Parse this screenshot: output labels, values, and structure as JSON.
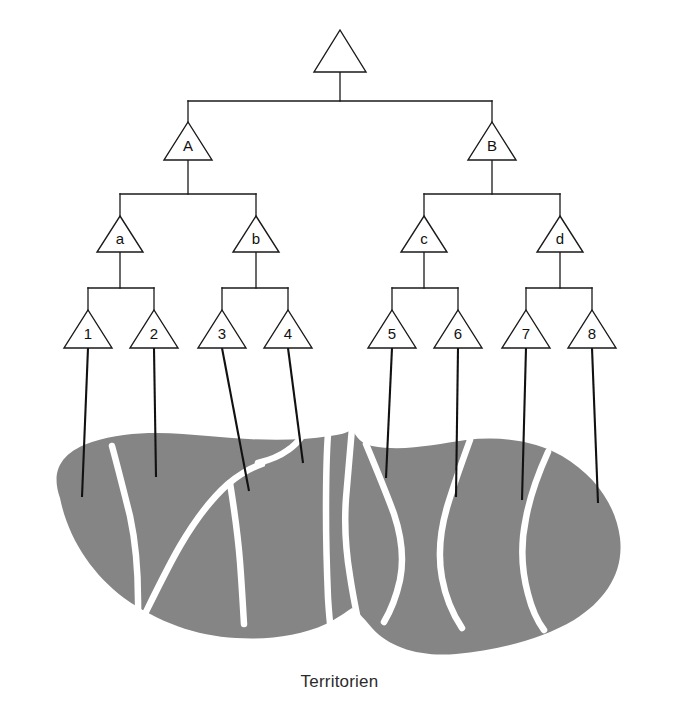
{
  "figure": {
    "caption": "Territorien",
    "colors": {
      "territory_fill": "#858585",
      "territory_border": "#ffffff",
      "line": "#111111",
      "background": "#ffffff"
    }
  },
  "diagram": {
    "type": "hierarchy-tree-with-map",
    "levels": 4,
    "nodes": {
      "root": {
        "label": "",
        "x": 340,
        "y": 55
      },
      "level2": [
        {
          "label": "A",
          "x": 188,
          "y": 143
        },
        {
          "label": "B",
          "x": 492,
          "y": 143
        }
      ],
      "level3": [
        {
          "label": "a",
          "x": 120,
          "y": 236
        },
        {
          "label": "b",
          "x": 256,
          "y": 236
        },
        {
          "label": "c",
          "x": 424,
          "y": 236
        },
        {
          "label": "d",
          "x": 560,
          "y": 236
        }
      ],
      "leaves": [
        {
          "label": "1",
          "x": 88,
          "y": 330
        },
        {
          "label": "2",
          "x": 154,
          "y": 330
        },
        {
          "label": "3",
          "x": 222,
          "y": 330
        },
        {
          "label": "4",
          "x": 288,
          "y": 330
        },
        {
          "label": "5",
          "x": 392,
          "y": 330
        },
        {
          "label": "6",
          "x": 458,
          "y": 330
        },
        {
          "label": "7",
          "x": 526,
          "y": 330
        },
        {
          "label": "8",
          "x": 592,
          "y": 330
        }
      ]
    },
    "edges": [
      {
        "from": "root",
        "to": "A"
      },
      {
        "from": "root",
        "to": "B"
      },
      {
        "from": "A",
        "to": "a"
      },
      {
        "from": "A",
        "to": "b"
      },
      {
        "from": "B",
        "to": "c"
      },
      {
        "from": "B",
        "to": "d"
      },
      {
        "from": "a",
        "to": "1"
      },
      {
        "from": "a",
        "to": "2"
      },
      {
        "from": "b",
        "to": "3"
      },
      {
        "from": "b",
        "to": "4"
      },
      {
        "from": "c",
        "to": "5"
      },
      {
        "from": "c",
        "to": "6"
      },
      {
        "from": "d",
        "to": "7"
      },
      {
        "from": "d",
        "to": "8"
      }
    ],
    "leader_lines": [
      {
        "leaf": "1",
        "x1": 88,
        "y1": 348,
        "x2": 82,
        "y2": 497
      },
      {
        "leaf": "2",
        "x1": 154,
        "y1": 348,
        "x2": 156,
        "y2": 477
      },
      {
        "leaf": "3",
        "x1": 222,
        "y1": 348,
        "x2": 249,
        "y2": 491
      },
      {
        "leaf": "4",
        "x1": 288,
        "y1": 348,
        "x2": 303,
        "y2": 463
      },
      {
        "leaf": "5",
        "x1": 392,
        "y1": 348,
        "x2": 386,
        "y2": 478
      },
      {
        "leaf": "6",
        "x1": 458,
        "y1": 348,
        "x2": 456,
        "y2": 497
      },
      {
        "leaf": "7",
        "x1": 526,
        "y1": 348,
        "x2": 522,
        "y2": 500
      },
      {
        "leaf": "8",
        "x1": 592,
        "y1": 348,
        "x2": 598,
        "y2": 503
      }
    ],
    "territories_count": 8,
    "territory_labels": [
      "1",
      "2",
      "3",
      "4",
      "5",
      "6",
      "7",
      "8"
    ]
  }
}
